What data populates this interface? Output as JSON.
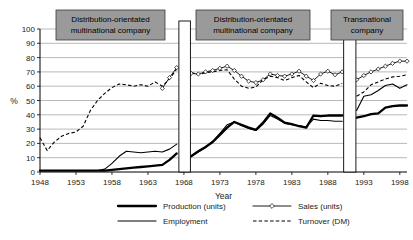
{
  "chart_data": {
    "type": "line",
    "title": "",
    "xlabel": "Year",
    "ylabel": "%",
    "xlim": [
      1948,
      1999
    ],
    "ylim": [
      0,
      100
    ],
    "grid": true,
    "legend_position": "bottom",
    "xticks": [
      1948,
      1953,
      1958,
      1963,
      1968,
      1973,
      1978,
      1983,
      1988,
      1993,
      1998
    ],
    "yticks": [
      0,
      10,
      20,
      30,
      40,
      50,
      60,
      70,
      80,
      90,
      100
    ],
    "annotations": [
      {
        "label": "Distribution-orientated multinational company",
        "line1": "Distribution-orientated",
        "line2": "multinational company",
        "phase_start": 1948,
        "phase_end": 1967
      },
      {
        "label": "Distribution-orientated multinational company",
        "line1": "Distribution-orientated",
        "line2": "multinational company",
        "phase_start": 1969,
        "phase_end": 1990
      },
      {
        "label": "Transnational company",
        "line1": "Transnational",
        "line2": "company",
        "phase_start": 1992,
        "phase_end": 1999
      }
    ],
    "phase_gaps": [
      [
        1967.3,
        1968.9
      ],
      [
        1990.2,
        1991.9
      ]
    ],
    "series": [
      {
        "name": "Production (units)",
        "style": "thick-solid",
        "x": [
          1948,
          1949,
          1950,
          1951,
          1952,
          1953,
          1954,
          1955,
          1956,
          1957,
          1958,
          1959,
          1960,
          1961,
          1962,
          1963,
          1964,
          1965,
          1966,
          1967,
          1969,
          1970,
          1971,
          1972,
          1973,
          1974,
          1975,
          1976,
          1977,
          1978,
          1979,
          1980,
          1981,
          1982,
          1983,
          1984,
          1985,
          1986,
          1987,
          1988,
          1989,
          1990,
          1992,
          1993,
          1994,
          1995,
          1996,
          1997,
          1998,
          1999
        ],
        "y": [
          1,
          1,
          1,
          1,
          1,
          1,
          1,
          1,
          1,
          1,
          1.5,
          2,
          2.5,
          3,
          3.5,
          4,
          4.5,
          5,
          8.5,
          13,
          11,
          14.5,
          17.5,
          21,
          26,
          31,
          35,
          33,
          31,
          29.5,
          34.5,
          41,
          38,
          34.5,
          33.5,
          32,
          31,
          39.5,
          39,
          39.5,
          39.5,
          39.5,
          38,
          39,
          40.5,
          41,
          45,
          46,
          46.5,
          46.5
        ],
        "unit": "%"
      },
      {
        "name": "Employment",
        "style": "thin-solid",
        "x": [
          1948,
          1949,
          1950,
          1951,
          1952,
          1953,
          1954,
          1955,
          1956,
          1957,
          1958,
          1959,
          1960,
          1961,
          1962,
          1963,
          1964,
          1965,
          1966,
          1967,
          1969,
          1970,
          1971,
          1972,
          1973,
          1974,
          1975,
          1976,
          1977,
          1978,
          1979,
          1980,
          1981,
          1982,
          1983,
          1984,
          1985,
          1986,
          1987,
          1988,
          1989,
          1990,
          1992,
          1993,
          1994,
          1995,
          1996,
          1997,
          1998,
          1999
        ],
        "y": [
          1,
          1,
          1,
          1,
          1,
          1,
          1,
          1,
          1,
          2,
          6,
          11,
          14.5,
          14,
          13.5,
          14,
          14.5,
          14,
          16,
          19.5,
          11,
          14,
          17,
          21.5,
          27,
          33,
          35,
          32.5,
          30.5,
          29,
          33.5,
          39.5,
          37,
          34,
          33,
          32.5,
          31.5,
          37,
          36,
          36,
          35.5,
          35.5,
          43,
          53,
          54,
          57,
          60.5,
          61.5,
          58.5,
          61
        ],
        "unit": "%"
      },
      {
        "name": "Sales (units)",
        "style": "marker-solid",
        "x": [
          1965,
          1966,
          1967,
          1969,
          1970,
          1971,
          1972,
          1973,
          1974,
          1975,
          1976,
          1977,
          1978,
          1979,
          1980,
          1981,
          1982,
          1983,
          1984,
          1985,
          1986,
          1987,
          1988,
          1989,
          1990,
          1992,
          1993,
          1994,
          1995,
          1996,
          1997,
          1998,
          1999
        ],
        "y": [
          58.5,
          66,
          73,
          69,
          68.5,
          70,
          71,
          72.5,
          74,
          71,
          67,
          63.5,
          62.5,
          64.5,
          68.5,
          67.5,
          67,
          68.5,
          70.5,
          67,
          64,
          68.5,
          70.5,
          68,
          70,
          64.5,
          67.5,
          70,
          72,
          74,
          76,
          77.5,
          77.5
        ],
        "unit": "%"
      },
      {
        "name": "Turnover (DM)",
        "style": "dashed",
        "x": [
          1948,
          1949,
          1950,
          1951,
          1952,
          1953,
          1954,
          1955,
          1956,
          1957,
          1958,
          1959,
          1960,
          1961,
          1962,
          1963,
          1964,
          1965,
          1966,
          1967,
          1969,
          1970,
          1971,
          1972,
          1973,
          1974,
          1975,
          1976,
          1977,
          1978,
          1979,
          1980,
          1981,
          1982,
          1983,
          1984,
          1985,
          1986,
          1987,
          1988,
          1989,
          1990,
          1992,
          1993,
          1994,
          1995,
          1996,
          1997,
          1998,
          1999
        ],
        "y": [
          24,
          15,
          21,
          25,
          27,
          28,
          32,
          43,
          50,
          55,
          59,
          61.5,
          61,
          60,
          61,
          60,
          63,
          60,
          65,
          72,
          69.5,
          68,
          69.5,
          70,
          71,
          71.5,
          65,
          60,
          58.5,
          59.5,
          64.5,
          67,
          66,
          64,
          66,
          67.5,
          63,
          59,
          62,
          60.5,
          60,
          62,
          53,
          56,
          61,
          63,
          65,
          66.5,
          67,
          68
        ],
        "unit": "%"
      }
    ]
  },
  "legend": {
    "items": [
      {
        "label": "Production (units)",
        "style": "thick-solid"
      },
      {
        "label": "Sales (units)",
        "style": "marker-solid"
      },
      {
        "label": "Employment",
        "style": "thin-solid"
      },
      {
        "label": "Turnover (DM)",
        "style": "dashed"
      }
    ]
  }
}
